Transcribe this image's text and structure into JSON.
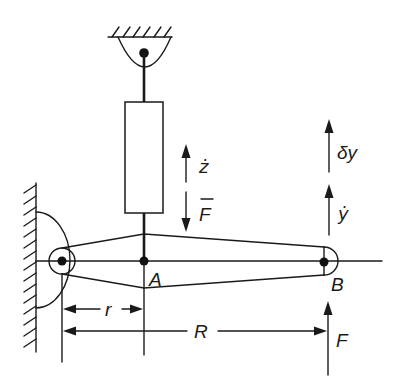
{
  "diagram": {
    "background": "#ffffff",
    "ink_color": "#1a1a1a",
    "points": [
      {
        "id": "A",
        "label": "A"
      },
      {
        "id": "B",
        "label": "B"
      }
    ],
    "dimensions": {
      "short_arm": {
        "label": "r"
      },
      "long_arm": {
        "label": "R"
      }
    },
    "damper": {
      "velocity_label": "ż",
      "force_label": "F",
      "force_overline": true
    },
    "end_b": {
      "virtual_displacement_label": "δy",
      "velocity_label": "ẏ",
      "applied_force_label": "F"
    }
  }
}
